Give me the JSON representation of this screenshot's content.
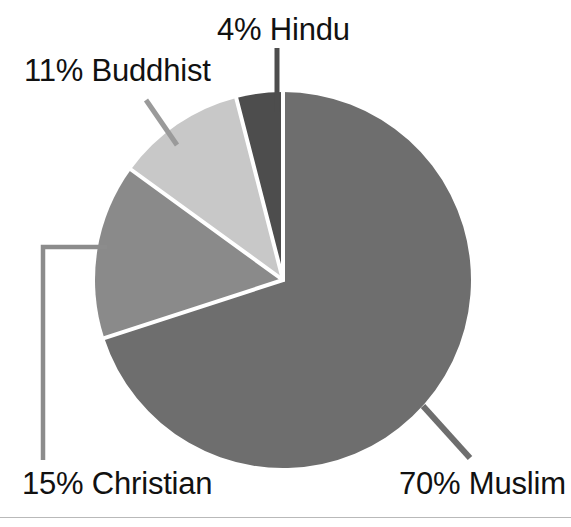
{
  "chart_data": {
    "type": "pie",
    "title": "",
    "subtitle": "",
    "xlabel": "",
    "ylabel": "",
    "legend_position": "callout-labels",
    "grid": false,
    "unit": "%",
    "categories": [
      "Muslim",
      "Christian",
      "Buddhist",
      "Hindu"
    ],
    "values": [
      70,
      15,
      11,
      4
    ],
    "slices": [
      {
        "name": "Muslim",
        "value": 70,
        "label": "70% Muslim",
        "color": "#6e6e6e",
        "start_angle_deg": 0,
        "end_angle_deg": 252,
        "leader_line": "diagonal",
        "label_position": "bottom-right"
      },
      {
        "name": "Christian",
        "value": 15,
        "label": "15% Christian",
        "color": "#8a8a8a",
        "start_angle_deg": 252,
        "end_angle_deg": 306,
        "leader_line": "elbow",
        "label_position": "bottom-left"
      },
      {
        "name": "Buddhist",
        "value": 11,
        "label": "11% Buddhist",
        "color": "#c8c8c8",
        "start_angle_deg": 306,
        "end_angle_deg": 345.6,
        "leader_line": "diagonal",
        "label_position": "top-left"
      },
      {
        "name": "Hindu",
        "value": 4,
        "label": "4% Hindu",
        "color": "#4d4d4d",
        "start_angle_deg": 345.6,
        "end_angle_deg": 360,
        "leader_line": "vertical",
        "label_position": "top-center"
      }
    ],
    "colors": {
      "muslim": "#6e6e6e",
      "christian": "#8a8a8a",
      "buddhist": "#c8c8c8",
      "hindu": "#4d4d4d",
      "slice_separator": "#ffffff",
      "leader_line": "#8c8c8c",
      "hindu_leader_line": "#4d4d4d",
      "muslim_leader_line": "#6e6e6e",
      "label_text": "#111111",
      "background": "#ffffff",
      "bottom_rule": "#b9b9b9"
    },
    "geometry": {
      "center_x": 283,
      "center_y": 280,
      "radius": 188
    }
  },
  "labels": {
    "hindu": "4% Hindu",
    "buddhist": "11% Buddhist",
    "christian": "15% Christian",
    "muslim": "70% Muslim"
  }
}
